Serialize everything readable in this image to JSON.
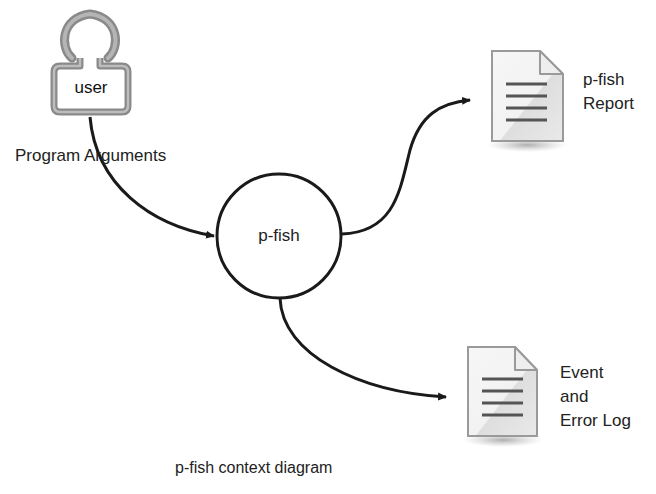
{
  "diagram": {
    "type": "context-diagram",
    "caption": "p-fish context diagram",
    "external_entity": {
      "name": "user",
      "icon": "user-icon"
    },
    "process": {
      "name": "p-fish",
      "shape": "circle"
    },
    "outputs": [
      {
        "id": "report",
        "icon": "document-icon",
        "label_lines": [
          "p-fish",
          "Report"
        ]
      },
      {
        "id": "log",
        "icon": "document-icon",
        "label_lines": [
          "Event",
          "and",
          "Error Log"
        ]
      }
    ],
    "flows": [
      {
        "from": "user",
        "to": "p-fish",
        "label": "Program Arguments"
      },
      {
        "from": "p-fish",
        "to": "report",
        "label": ""
      },
      {
        "from": "p-fish",
        "to": "log",
        "label": ""
      }
    ]
  }
}
